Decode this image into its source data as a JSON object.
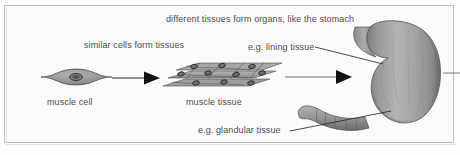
{
  "figure": {
    "title_caption": "different tissues form organs, like the stomach",
    "labels": {
      "organs": "different tissues form organs, like the stomach",
      "similar_cells": "similar cells form tissues",
      "lining_tissue": "e.g. lining tissue",
      "muscle_cell": "muscle cell",
      "muscle_tissue": "muscle tissue",
      "glandular_tissue": "e.g. glandular tissue"
    },
    "colors": {
      "text": "#4d4d4d",
      "frame_border": "#bdbdbd",
      "background": "#fbfbfb",
      "cell_fill": "#8f8f8f",
      "cell_outline": "#3a3a3a",
      "nucleus_fill": "#6e6e6e",
      "organ_fill": "#a3a3a3",
      "organ_outline": "#555555",
      "arrow": "#1a1a1a",
      "leader_line": "#2b2b2b"
    },
    "stages": [
      {
        "name": "cell",
        "label": "muscle cell"
      },
      {
        "name": "tissue",
        "label": "muscle tissue"
      },
      {
        "name": "organ",
        "label": "stomach"
      }
    ],
    "arrows": [
      {
        "from": "muscle cell",
        "to": "muscle tissue"
      },
      {
        "from": "muscle tissue",
        "to": "stomach"
      }
    ],
    "callouts": [
      {
        "label": "e.g. lining tissue",
        "target": "stomach inner wall"
      },
      {
        "label": "e.g. glandular tissue",
        "target": "stomach lower body"
      }
    ]
  }
}
